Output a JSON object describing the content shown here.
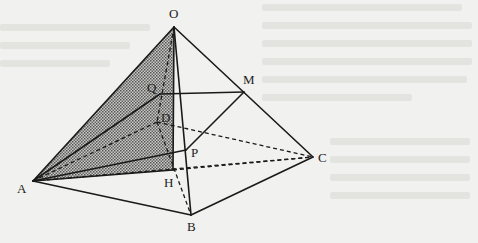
{
  "diagram": {
    "colors": {
      "background": "#f1f1ef",
      "stroke": "#1a1a1a",
      "shade": "#9a9a9a",
      "ghost_text": "#e3e3e0"
    },
    "points": {
      "O": {
        "label": "O",
        "x": 174,
        "y": 27,
        "lx": 169,
        "ly": 18
      },
      "A": {
        "label": "A",
        "x": 33,
        "y": 181,
        "lx": 17,
        "ly": 193
      },
      "B": {
        "label": "B",
        "x": 191,
        "y": 215,
        "lx": 187,
        "ly": 231
      },
      "C": {
        "label": "C",
        "x": 313,
        "y": 157,
        "lx": 318,
        "ly": 162
      },
      "D": {
        "label": "D",
        "x": 157,
        "y": 122,
        "lx": 161,
        "ly": 122
      },
      "H": {
        "label": "H",
        "x": 173,
        "y": 170,
        "lx": 164,
        "ly": 187
      },
      "P": {
        "label": "P",
        "x": 186,
        "y": 150,
        "lx": 191,
        "ly": 157
      },
      "Q": {
        "label": "Q",
        "x": 160,
        "y": 94,
        "lx": 147,
        "ly": 92
      },
      "M": {
        "label": "M",
        "x": 244,
        "y": 92,
        "lx": 243,
        "ly": 84
      }
    },
    "solid_edges": [
      [
        "O",
        "A"
      ],
      [
        "O",
        "B"
      ],
      [
        "O",
        "C"
      ],
      [
        "A",
        "B"
      ],
      [
        "B",
        "C"
      ],
      [
        "Q",
        "M"
      ],
      [
        "M",
        "P"
      ],
      [
        "A",
        "Q"
      ],
      [
        "A",
        "P"
      ],
      [
        "A",
        "H"
      ],
      [
        "O",
        "H"
      ]
    ],
    "dashed_edges": [
      [
        "O",
        "D"
      ],
      [
        "A",
        "D"
      ],
      [
        "D",
        "C"
      ],
      [
        "D",
        "B"
      ],
      [
        "A",
        "C"
      ],
      [
        "H",
        "C"
      ]
    ],
    "shaded_region": [
      "O",
      "A",
      "H"
    ]
  }
}
